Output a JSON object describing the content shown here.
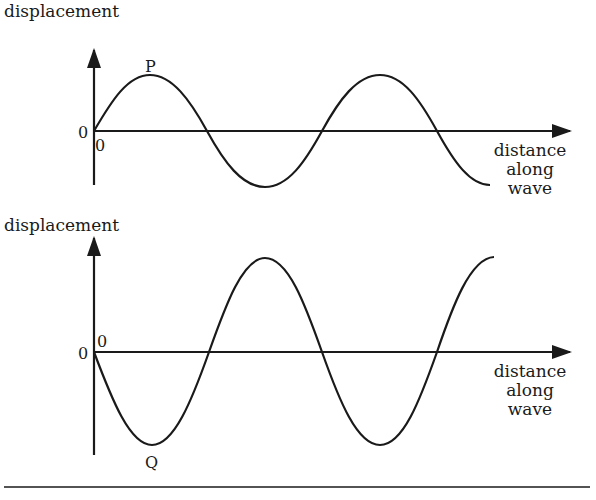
{
  "figure": {
    "colors": {
      "ink": "#1a1a1a",
      "background": "#ffffff"
    },
    "top_graph": {
      "y_axis_label": "displacement",
      "x_axis_label_lines": [
        "distance",
        "along",
        "wave"
      ],
      "origin_label_y": "0",
      "origin_label_x": "0",
      "point_label": "P",
      "point_description": "crest (maximum positive displacement)",
      "wave": "sine starting at 0 going up; ~1.75 wavelengths"
    },
    "bottom_graph": {
      "y_axis_label": "displacement",
      "x_axis_label_lines": [
        "distance",
        "along",
        "wave"
      ],
      "origin_label_y": "0",
      "origin_label_x": "0",
      "point_label": "Q",
      "point_description": "trough (maximum negative displacement)",
      "wave": "sine starting at 0 going down; ~1.75 wavelengths, larger amplitude"
    }
  }
}
